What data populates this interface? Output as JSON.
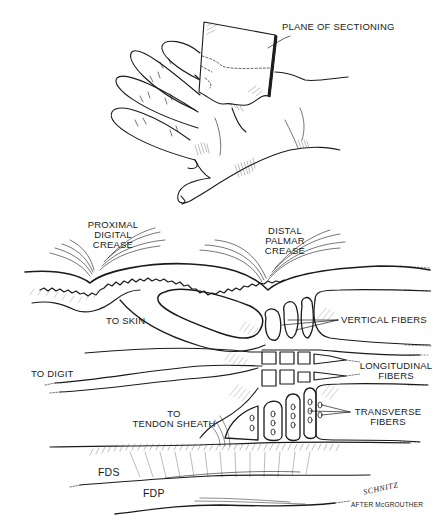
{
  "figure": {
    "top_illustration": {
      "subject": "open hand with sectioning plane",
      "labels": {
        "plane": "PLANE OF SECTIONING"
      }
    },
    "section_diagram": {
      "labels": {
        "proximal_digital_crease": "PROXIMAL\nDIGITAL\nCREASE",
        "distal_palmar_crease": "DISTAL\nPALMAR\nCREASE",
        "to_skin": "TO SKIN",
        "vertical_fibers": "VERTICAL FIBERS",
        "to_digit": "TO DIGIT",
        "longitudinal_fibers": "LONGITUDINAL\nFIBERS",
        "to_tendon_sheath": "TO\nTENDON SHEATH",
        "transverse_fibers": "TRANSVERSE\nFIBERS",
        "fds": "FDS",
        "fdp": "FDP"
      }
    },
    "credits": {
      "artist_signature": "SCHNITZ",
      "attribution": "AFTER McGROUTHER"
    },
    "colors": {
      "ink": "#1a1a1a",
      "background": "#ffffff",
      "hatch": "#555555"
    }
  }
}
